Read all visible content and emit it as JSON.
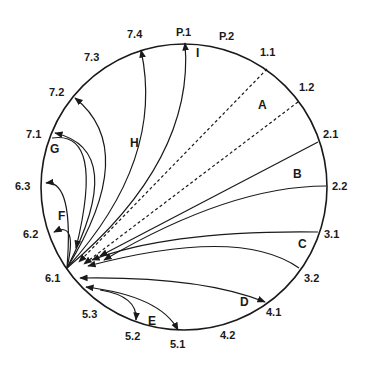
{
  "diagram": {
    "type": "chord-circle",
    "hub": "6.1",
    "circle": {
      "cx": 184,
      "cy": 187,
      "r": 143
    },
    "colors": {
      "stroke": "#1a1a1a",
      "background": "#ffffff"
    },
    "node_labels": [
      {
        "id": "P.1",
        "x": 176,
        "y": 36
      },
      {
        "id": "P.2",
        "x": 219,
        "y": 40
      },
      {
        "id": "1.1",
        "x": 260,
        "y": 56
      },
      {
        "id": "1.2",
        "x": 299,
        "y": 91
      },
      {
        "id": "2.1",
        "x": 323,
        "y": 138
      },
      {
        "id": "2.2",
        "x": 332,
        "y": 190
      },
      {
        "id": "3.1",
        "x": 324,
        "y": 238
      },
      {
        "id": "3.2",
        "x": 304,
        "y": 282
      },
      {
        "id": "4.1",
        "x": 266,
        "y": 316
      },
      {
        "id": "4.2",
        "x": 220,
        "y": 339
      },
      {
        "id": "5.1",
        "x": 170,
        "y": 348
      },
      {
        "id": "5.2",
        "x": 125,
        "y": 340
      },
      {
        "id": "5.3",
        "x": 82,
        "y": 318
      },
      {
        "id": "6.1",
        "x": 45,
        "y": 282
      },
      {
        "id": "6.2",
        "x": 23,
        "y": 238
      },
      {
        "id": "6.3",
        "x": 15,
        "y": 190
      },
      {
        "id": "7.1",
        "x": 26,
        "y": 138
      },
      {
        "id": "7.2",
        "x": 49,
        "y": 96
      },
      {
        "id": "7.3",
        "x": 84,
        "y": 61
      },
      {
        "id": "7.4",
        "x": 127,
        "y": 38
      }
    ],
    "group_labels": [
      {
        "id": "A",
        "x": 258,
        "y": 109
      },
      {
        "id": "B",
        "x": 293,
        "y": 178
      },
      {
        "id": "C",
        "x": 298,
        "y": 248
      },
      {
        "id": "D",
        "x": 240,
        "y": 306
      },
      {
        "id": "E",
        "x": 148,
        "y": 325
      },
      {
        "id": "F",
        "x": 58,
        "y": 220
      },
      {
        "id": "G",
        "x": 50,
        "y": 153
      },
      {
        "id": "H",
        "x": 130,
        "y": 147
      },
      {
        "id": "I",
        "x": 196,
        "y": 57
      }
    ],
    "edges": [
      {
        "group": "A",
        "from": "1.1",
        "to": "6.1",
        "style": "dashed",
        "arrow": "to"
      },
      {
        "group": "A",
        "from": "1.2",
        "to": "6.1",
        "style": "dashed",
        "arrow": "to"
      },
      {
        "group": "B",
        "from": "2.1",
        "to": "6.1",
        "style": "solid",
        "arrow": "to"
      },
      {
        "group": "B",
        "from": "2.2",
        "to": "6.1",
        "style": "solid",
        "arrow": "to"
      },
      {
        "group": "C",
        "from": "3.1",
        "to": "6.1",
        "style": "solid",
        "arrow": "to"
      },
      {
        "group": "C",
        "from": "3.2",
        "to": "6.1",
        "style": "solid",
        "arrow": "to"
      },
      {
        "group": "D",
        "from": "6.1",
        "to": "4.1",
        "style": "solid",
        "arrow": "both"
      },
      {
        "group": "E",
        "from": "6.1",
        "to": "5.1",
        "style": "solid",
        "arrow": "both"
      },
      {
        "group": "E",
        "from": "6.1",
        "to": "5.2",
        "style": "solid",
        "arrow": "to"
      },
      {
        "group": "F",
        "from": "6.1",
        "to": "6.2",
        "style": "solid",
        "arrow": "to"
      },
      {
        "group": "F",
        "from": "6.1",
        "to": "6.3",
        "style": "solid",
        "arrow": "to"
      },
      {
        "group": "G",
        "from": "7.1",
        "to": "6.1",
        "style": "solid",
        "arrow": "to"
      },
      {
        "group": "G",
        "from": "6.1",
        "to": "7.1",
        "style": "solid",
        "arrow": "to"
      },
      {
        "group": "H",
        "from": "6.1",
        "to": "7.2",
        "style": "solid",
        "arrow": "to"
      },
      {
        "group": "H",
        "from": "6.1",
        "to": "7.4",
        "style": "solid",
        "arrow": "to"
      },
      {
        "group": "I",
        "from": "6.1",
        "to": "P.1",
        "style": "solid",
        "arrow": "to"
      }
    ]
  }
}
